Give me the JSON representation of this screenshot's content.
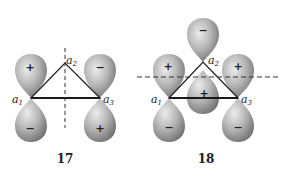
{
  "diagrams": [
    {
      "label": "17",
      "atoms": [
        {
          "name": "a",
          "sub": "1"
        },
        {
          "name": "a",
          "sub": "2"
        },
        {
          "name": "a",
          "sub": "3"
        }
      ],
      "lobes": [
        {
          "position": "a1-up",
          "sign": "+"
        },
        {
          "position": "a1-down",
          "sign": "−"
        },
        {
          "position": "a3-up",
          "sign": "−"
        },
        {
          "position": "a3-down",
          "sign": "+"
        }
      ],
      "symmetry_plane": "vertical"
    },
    {
      "label": "18",
      "atoms": [
        {
          "name": "a",
          "sub": "1"
        },
        {
          "name": "a",
          "sub": "2"
        },
        {
          "name": "a",
          "sub": "3"
        }
      ],
      "lobes": [
        {
          "position": "a2-up",
          "sign": "−"
        },
        {
          "position": "a2-down",
          "sign": "+"
        },
        {
          "position": "a1-up",
          "sign": "+"
        },
        {
          "position": "a1-down",
          "sign": "−"
        },
        {
          "position": "a3-up",
          "sign": "+"
        },
        {
          "position": "a3-down",
          "sign": "−"
        }
      ],
      "symmetry_plane": "horizontal"
    }
  ],
  "colors": {
    "lobe_light": "#e6e6e6",
    "lobe_dark": "#6e6e6e",
    "line": "#1a1a1a"
  }
}
